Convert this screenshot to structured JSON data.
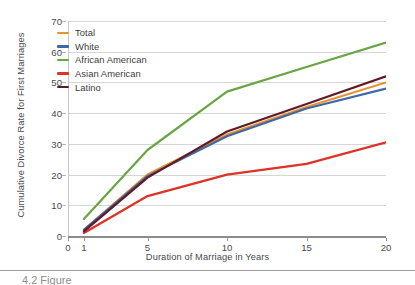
{
  "chart_data": {
    "type": "line",
    "title": "",
    "xlabel": "Duration of Marriage in Years",
    "ylabel": "Cumulative Divorce Rate for First Marriages",
    "x": [
      1,
      5,
      10,
      15,
      20
    ],
    "xlim": [
      0,
      20
    ],
    "ylim": [
      0,
      70
    ],
    "xticks": [
      0,
      1,
      5,
      10,
      15,
      20
    ],
    "yticks": [
      0,
      10,
      20,
      30,
      40,
      50,
      60,
      70
    ],
    "grid": "horizontal",
    "legend_position": "top-left",
    "series": [
      {
        "name": "Total",
        "color": "#E8922E",
        "values": [
          2.0,
          20.0,
          33.0,
          42.0,
          50.0
        ]
      },
      {
        "name": "White",
        "color": "#3E67A8",
        "values": [
          2.0,
          19.5,
          32.5,
          41.5,
          48.0
        ]
      },
      {
        "name": "African American",
        "color": "#6AA544",
        "values": [
          5.5,
          28.0,
          47.0,
          55.0,
          63.0
        ]
      },
      {
        "name": "Asian American",
        "color": "#E03126",
        "values": [
          1.0,
          13.0,
          20.0,
          23.5,
          30.5
        ]
      },
      {
        "name": "Latino",
        "color": "#5E1B28",
        "values": [
          1.5,
          19.0,
          34.0,
          43.0,
          52.0
        ]
      }
    ]
  },
  "axis": {
    "y_tick_labels": [
      "0",
      "10",
      "20",
      "30",
      "40",
      "50",
      "60",
      "70"
    ],
    "x_tick_labels": [
      "0",
      "1",
      "5",
      "10",
      "15",
      "20"
    ],
    "x_title": "Duration of Marriage in Years",
    "y_title": "Cumulative Divorce Rate for First Marriages"
  },
  "legend": {
    "items": [
      {
        "label": "Total"
      },
      {
        "label": "White"
      },
      {
        "label": "African American"
      },
      {
        "label": "Asian American"
      },
      {
        "label": "Latino"
      }
    ]
  },
  "footer": {
    "caption_partial": "4.2  Figure"
  }
}
